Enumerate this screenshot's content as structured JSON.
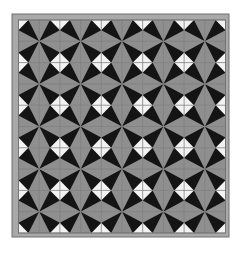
{
  "image": {
    "subject": "geometric quilt pattern of black, gray and white triangles forming pinwheel stars and white diamonds",
    "width": 242,
    "height": 253
  },
  "frame": {
    "x": 12,
    "y": 14,
    "width": 217,
    "height": 223,
    "color": "#a9a9a9",
    "outline": "#6e6e6e"
  },
  "tiles": {
    "x": 18.5,
    "y": 20,
    "width": 207,
    "height": 213,
    "cols": 10,
    "rows": 10,
    "inset_ratio": 0.48
  },
  "colors": {
    "black": "#141414",
    "gray": "#8f8f8f",
    "white": "#f2f2f2",
    "grid_line": "#7d7d7d"
  }
}
